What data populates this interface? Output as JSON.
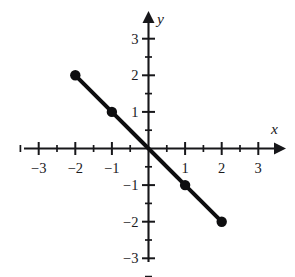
{
  "chart_data": {
    "type": "line",
    "title": "",
    "subtitle": "",
    "xlabel": "x",
    "ylabel": "y",
    "xlim": [
      -3.4,
      3.4
    ],
    "ylim": [
      -3.4,
      3.4
    ],
    "grid": false,
    "legend": null,
    "axis_style": "cartesian-cross-with-arrows",
    "equation": "y = -x",
    "x_ticks_major": [
      -3,
      -2,
      -1,
      1,
      2,
      3
    ],
    "x_ticks_minor": [
      -3.5,
      -2.5,
      -1.5,
      -0.5,
      0.5,
      1.5,
      2.5,
      3.5
    ],
    "y_ticks_major": [
      -3,
      -2,
      -1,
      1,
      2,
      3
    ],
    "y_ticks_minor": [
      -3.5,
      -2.5,
      -1.5,
      -0.5,
      0.5,
      1.5,
      2.5
    ],
    "x_tick_labels": [
      "−3",
      "−2",
      "−1",
      "1",
      "2",
      "3"
    ],
    "y_tick_labels": [
      "−3",
      "−2",
      "−1",
      "1",
      "2",
      "3"
    ],
    "series": [
      {
        "name": "y = -x",
        "marker": "filled-circle",
        "color": "#0e0e10",
        "x": [
          -2,
          -1,
          0,
          1,
          2
        ],
        "y": [
          2,
          1,
          0,
          -1,
          -2
        ],
        "points": [
          {
            "x": -2,
            "y": 2
          },
          {
            "x": -1,
            "y": 1
          },
          {
            "x": 0,
            "y": 0
          },
          {
            "x": 1,
            "y": -1
          },
          {
            "x": 2,
            "y": -2
          }
        ]
      }
    ]
  },
  "figure": {
    "x_axis_label": "x",
    "y_axis_label": "y",
    "x_labels": [
      {
        "value": -3,
        "text": "−3"
      },
      {
        "value": -2,
        "text": "−2"
      },
      {
        "value": -1,
        "text": "−1"
      },
      {
        "value": 1,
        "text": "1"
      },
      {
        "value": 2,
        "text": "2"
      },
      {
        "value": 3,
        "text": "3"
      }
    ],
    "y_labels": [
      {
        "value": 3,
        "text": "3"
      },
      {
        "value": 2,
        "text": "2"
      },
      {
        "value": 1,
        "text": "1"
      },
      {
        "value": -1,
        "text": "−1"
      },
      {
        "value": -2,
        "text": "−2"
      },
      {
        "value": -3,
        "text": "−3"
      }
    ],
    "colors": {
      "axis": "#17171a",
      "data": "#0e0e10",
      "background": "#ffffff"
    }
  }
}
